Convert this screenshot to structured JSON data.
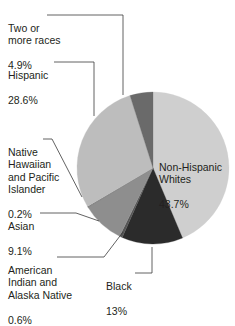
{
  "chart_data": {
    "type": "pie",
    "title": "",
    "start_angle_deg": 0,
    "direction": "clockwise",
    "slices": [
      {
        "name": "Non-Hispanic Whites",
        "value": 43.7,
        "label": "Non-Hispanic\nWhites",
        "value_label": "43.7%",
        "color": "#cfcfcf"
      },
      {
        "name": "Black",
        "value": 13.0,
        "label": "Black",
        "value_label": "13%",
        "color": "#2b2b2b"
      },
      {
        "name": "American Indian and Alaska Native",
        "value": 0.6,
        "label": "American\nIndian and\nAlaska Native",
        "value_label": "0.6%",
        "color": "#555555"
      },
      {
        "name": "Asian",
        "value": 9.1,
        "label": "Asian",
        "value_label": "9.1%",
        "color": "#8e8e8e"
      },
      {
        "name": "Native Hawaiian and Pacific Islander",
        "value": 0.2,
        "label": "Native\nHawaiian\nand Pacific\nIslander",
        "value_label": "0.2%",
        "color": "#6e6e6e"
      },
      {
        "name": "Hispanic",
        "value": 28.6,
        "label": "Hispanic",
        "value_label": "28.6%",
        "color": "#bdbdbd"
      },
      {
        "name": "Two or more races",
        "value": 4.9,
        "label": "Two or\nmore races",
        "value_label": "4.9%",
        "color": "#6a6a6a"
      }
    ],
    "legend": "none (leader-line labels)",
    "grid": false
  },
  "labels": {
    "two_or_more": {
      "text": "Two or\nmore races",
      "value": "4.9%"
    },
    "hispanic": {
      "text": "Hispanic",
      "value": "28.6%"
    },
    "native_hawaiian": {
      "text": "Native\nHawaiian\nand Pacific\nIslander",
      "value": "0.2%"
    },
    "asian": {
      "text": "Asian",
      "value": "9.1%"
    },
    "american_indian": {
      "text": "American\nIndian and\nAlaska Native",
      "value": "0.6%"
    },
    "black": {
      "text": "Black",
      "value": "13%"
    },
    "white": {
      "text": "Non-Hispanic\nWhites",
      "value": "43.7%"
    }
  }
}
